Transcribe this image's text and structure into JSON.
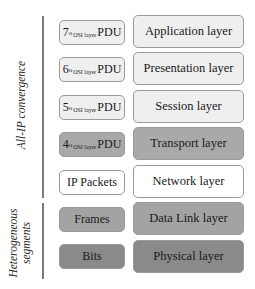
{
  "groups": {
    "convergence_label": "All-IP convergence",
    "heterogeneous_label_line1": "Heterogeneous",
    "heterogeneous_label_line2": "segments"
  },
  "rows": [
    {
      "pdu": {
        "num": "7",
        "sup": "o",
        "sub": "OSI layer",
        "word": "PDU",
        "text": ""
      },
      "layer": "Application layer",
      "pdu_fill": "#efefef",
      "layer_fill": "#efefef"
    },
    {
      "pdu": {
        "num": "6",
        "sup": "o",
        "sub": "OSI layer",
        "word": "PDU",
        "text": ""
      },
      "layer": "Presentation layer",
      "pdu_fill": "#efefef",
      "layer_fill": "#efefef"
    },
    {
      "pdu": {
        "num": "5",
        "sup": "o",
        "sub": "OSI layer",
        "word": "PDU",
        "text": ""
      },
      "layer": "Session layer",
      "pdu_fill": "#efefef",
      "layer_fill": "#efefef"
    },
    {
      "pdu": {
        "num": "4",
        "sup": "o",
        "sub": "OSI layer",
        "word": "PDU",
        "text": ""
      },
      "layer": "Transport layer",
      "pdu_fill": "#a9a9a9",
      "layer_fill": "#a9a9a9"
    },
    {
      "pdu": {
        "text": "IP Packets"
      },
      "layer": "Network layer",
      "pdu_fill": "#ffffff",
      "layer_fill": "#ffffff"
    },
    {
      "pdu": {
        "text": "Frames"
      },
      "layer": "Data Link layer",
      "pdu_fill": "#a3a3a3",
      "layer_fill": "#a3a3a3"
    },
    {
      "pdu": {
        "text": "Bits"
      },
      "layer": "Physical layer",
      "pdu_fill": "#8a8a8a",
      "layer_fill": "#8a8a8a"
    }
  ]
}
